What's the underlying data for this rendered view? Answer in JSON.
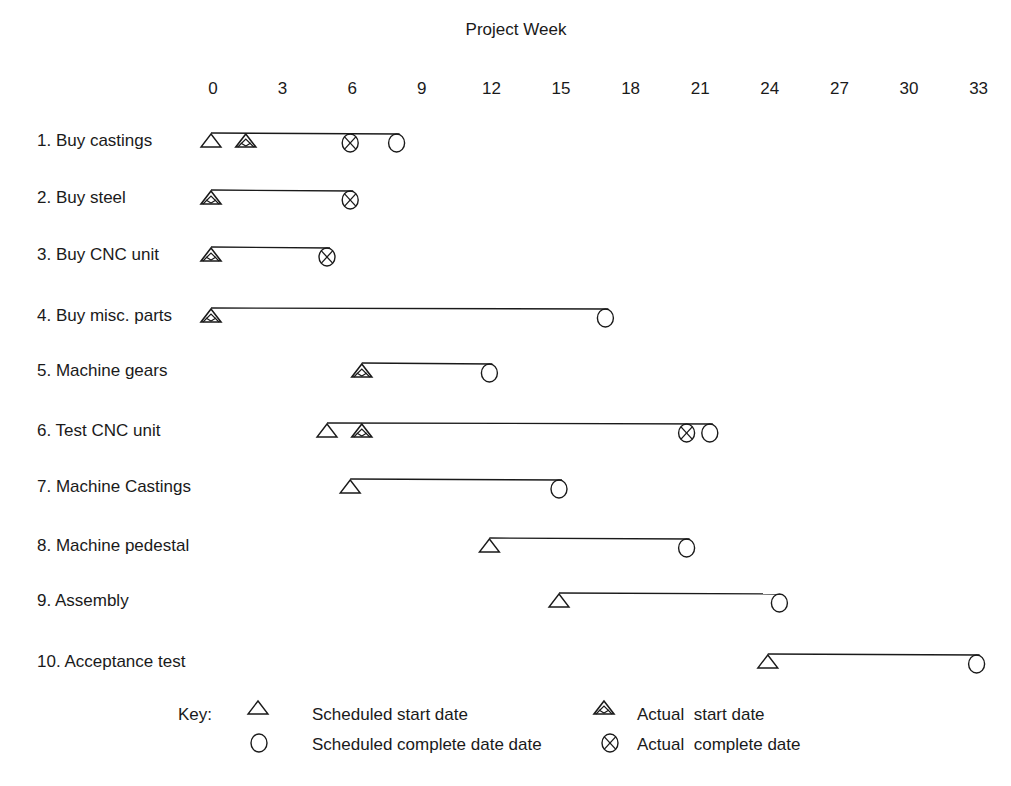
{
  "chart_data": {
    "type": "gantt",
    "title": "Project Week",
    "xlabel": "Project Week",
    "ylabel": "",
    "xlim": [
      0,
      33
    ],
    "x_ticks": [
      0,
      3,
      6,
      9,
      12,
      15,
      18,
      21,
      24,
      27,
      30,
      33
    ],
    "grid": false,
    "legend_position": "bottom-left",
    "tasks": [
      {
        "label": "1. Buy castings",
        "scheduled_start": 0,
        "actual_start": 1.5,
        "actual_complete": 6,
        "scheduled_complete": 8
      },
      {
        "label": "2. Buy steel",
        "scheduled_start": null,
        "actual_start": 0,
        "actual_complete": 6,
        "scheduled_complete": null
      },
      {
        "label": "3. Buy CNC unit",
        "scheduled_start": null,
        "actual_start": 0,
        "actual_complete": 5,
        "scheduled_complete": null
      },
      {
        "label": "4. Buy misc. parts",
        "scheduled_start": null,
        "actual_start": 0,
        "actual_complete": null,
        "scheduled_complete": 17
      },
      {
        "label": "5. Machine gears",
        "scheduled_start": null,
        "actual_start": 6.5,
        "actual_complete": null,
        "scheduled_complete": 12
      },
      {
        "label": "6. Test CNC unit",
        "scheduled_start": 5,
        "actual_start": 6.5,
        "actual_complete": 20.5,
        "scheduled_complete": 21.5
      },
      {
        "label": "7. Machine Castings",
        "scheduled_start": 6,
        "actual_start": null,
        "actual_complete": null,
        "scheduled_complete": 15
      },
      {
        "label": "8. Machine pedestal",
        "scheduled_start": 12,
        "actual_start": null,
        "actual_complete": null,
        "scheduled_complete": 20.5
      },
      {
        "label": "9. Assembly",
        "scheduled_start": 15,
        "actual_start": null,
        "actual_complete": null,
        "scheduled_complete": 24.5
      },
      {
        "label": "10. Acceptance test",
        "scheduled_start": 24,
        "actual_start": null,
        "actual_complete": null,
        "scheduled_complete": 33
      }
    ],
    "legend": {
      "title": "Key:",
      "entries": [
        {
          "symbol": "scheduled-start-triangle",
          "label": "Scheduled start date"
        },
        {
          "symbol": "actual-start-hatched-triangle",
          "label": "Actual  start date"
        },
        {
          "symbol": "scheduled-complete-circle",
          "label": "Scheduled complete date date"
        },
        {
          "symbol": "actual-complete-crossed-circle",
          "label": "Actual  complete date"
        }
      ]
    },
    "colors": {
      "ink": "#1a1a1a",
      "background": "#ffffff"
    }
  }
}
